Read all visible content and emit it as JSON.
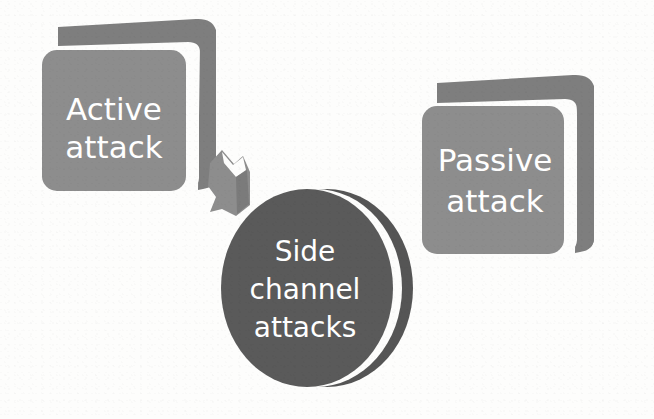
{
  "diagram": {
    "type": "concept-diagram",
    "title": "Side channel attacks",
    "background_color": "#fdfdfc",
    "nodes": [
      {
        "id": "active-attack",
        "shape": "rounded-rectangle-3d",
        "lines": [
          "Active",
          "attack"
        ],
        "text": "Active attack",
        "face_color": "#8d8d8d",
        "side_color": "#7e7e7e",
        "gap_color": "#fdfdfc",
        "text_color": "#ffffff"
      },
      {
        "id": "passive-attack",
        "shape": "rounded-rectangle-3d",
        "lines": [
          "Passive",
          "attack"
        ],
        "text": "Passive attack",
        "face_color": "#8d8d8d",
        "side_color": "#7e7e7e",
        "gap_color": "#fdfdfc",
        "text_color": "#ffffff"
      },
      {
        "id": "side-channel-attacks",
        "shape": "circle-3d",
        "lines": [
          "Side",
          "channel",
          "attacks"
        ],
        "text": "Side channel attacks",
        "face_color": "#5a5a5a",
        "side_color": "#555555",
        "gap_color": "#fdfdfc",
        "text_color": "#ffffff"
      }
    ],
    "connectors": [
      {
        "id": "active-to-side-channel",
        "shape": "block-arrow",
        "direction": "down-right",
        "from": "active-attack",
        "to": "side-channel-attacks",
        "color": "#8d8d8d",
        "edge_color": "#6f6f6f"
      }
    ]
  }
}
